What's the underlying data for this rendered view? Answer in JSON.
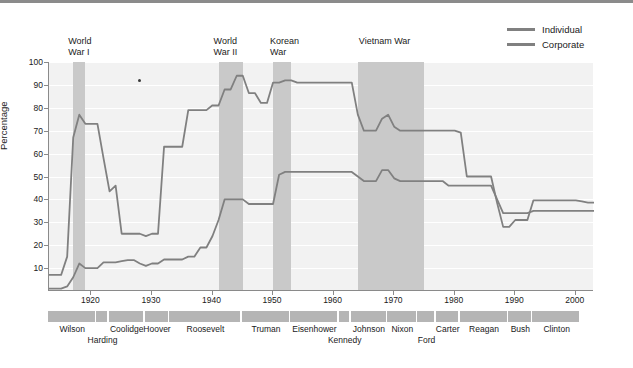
{
  "chart_data": {
    "type": "line",
    "title": "",
    "xlabel": "",
    "ylabel": "Percentage",
    "xlim": [
      1913,
      2003
    ],
    "ylim": [
      0,
      100
    ],
    "grid": true,
    "legend_position": "top-right",
    "yticks": [
      10,
      20,
      30,
      40,
      50,
      60,
      70,
      80,
      90,
      100
    ],
    "xticks": [
      1920,
      1930,
      1940,
      1950,
      1960,
      1970,
      1980,
      1990,
      2000
    ],
    "series": [
      {
        "name": "Individual",
        "color": "#808080",
        "points": [
          [
            1913,
            7
          ],
          [
            1914,
            7
          ],
          [
            1915,
            7
          ],
          [
            1916,
            15
          ],
          [
            1917,
            67
          ],
          [
            1918,
            77
          ],
          [
            1919,
            73
          ],
          [
            1920,
            73
          ],
          [
            1921,
            73
          ],
          [
            1922,
            58
          ],
          [
            1923,
            43.5
          ],
          [
            1924,
            46
          ],
          [
            1925,
            25
          ],
          [
            1926,
            25
          ],
          [
            1927,
            25
          ],
          [
            1928,
            25
          ],
          [
            1929,
            24
          ],
          [
            1930,
            25
          ],
          [
            1931,
            25
          ],
          [
            1932,
            63
          ],
          [
            1933,
            63
          ],
          [
            1934,
            63
          ],
          [
            1935,
            63
          ],
          [
            1936,
            79
          ],
          [
            1937,
            79
          ],
          [
            1938,
            79
          ],
          [
            1939,
            79
          ],
          [
            1940,
            81.1
          ],
          [
            1941,
            81
          ],
          [
            1942,
            88
          ],
          [
            1943,
            88
          ],
          [
            1944,
            94
          ],
          [
            1945,
            94
          ],
          [
            1946,
            86.45
          ],
          [
            1947,
            86.45
          ],
          [
            1948,
            82.13
          ],
          [
            1949,
            82.13
          ],
          [
            1950,
            91
          ],
          [
            1951,
            91
          ],
          [
            1952,
            92
          ],
          [
            1953,
            92
          ],
          [
            1954,
            91
          ],
          [
            1955,
            91
          ],
          [
            1956,
            91
          ],
          [
            1957,
            91
          ],
          [
            1958,
            91
          ],
          [
            1959,
            91
          ],
          [
            1960,
            91
          ],
          [
            1961,
            91
          ],
          [
            1962,
            91
          ],
          [
            1963,
            91
          ],
          [
            1964,
            77
          ],
          [
            1965,
            70
          ],
          [
            1966,
            70
          ],
          [
            1967,
            70
          ],
          [
            1968,
            75.25
          ],
          [
            1969,
            77
          ],
          [
            1970,
            71.75
          ],
          [
            1971,
            70
          ],
          [
            1972,
            70
          ],
          [
            1973,
            70
          ],
          [
            1974,
            70
          ],
          [
            1975,
            70
          ],
          [
            1976,
            70
          ],
          [
            1977,
            70
          ],
          [
            1978,
            70
          ],
          [
            1979,
            70
          ],
          [
            1980,
            70
          ],
          [
            1981,
            69.125
          ],
          [
            1982,
            50
          ],
          [
            1983,
            50
          ],
          [
            1984,
            50
          ],
          [
            1985,
            50
          ],
          [
            1986,
            50
          ],
          [
            1987,
            38.5
          ],
          [
            1988,
            28
          ],
          [
            1989,
            28
          ],
          [
            1990,
            31
          ],
          [
            1991,
            31
          ],
          [
            1992,
            31
          ],
          [
            1993,
            39.6
          ],
          [
            1994,
            39.6
          ],
          [
            1995,
            39.6
          ],
          [
            1996,
            39.6
          ],
          [
            1997,
            39.6
          ],
          [
            1998,
            39.6
          ],
          [
            1999,
            39.6
          ],
          [
            2000,
            39.6
          ],
          [
            2001,
            39.1
          ],
          [
            2002,
            38.6
          ],
          [
            2003,
            38.6
          ]
        ]
      },
      {
        "name": "Corporate",
        "color": "#808080",
        "points": [
          [
            1913,
            1
          ],
          [
            1914,
            1
          ],
          [
            1915,
            1
          ],
          [
            1916,
            2
          ],
          [
            1917,
            6
          ],
          [
            1918,
            12
          ],
          [
            1919,
            10
          ],
          [
            1920,
            10
          ],
          [
            1921,
            10
          ],
          [
            1922,
            12.5
          ],
          [
            1923,
            12.5
          ],
          [
            1924,
            12.5
          ],
          [
            1925,
            13
          ],
          [
            1926,
            13.5
          ],
          [
            1927,
            13.5
          ],
          [
            1928,
            12
          ],
          [
            1929,
            11
          ],
          [
            1930,
            12
          ],
          [
            1931,
            12
          ],
          [
            1932,
            13.75
          ],
          [
            1933,
            13.75
          ],
          [
            1934,
            13.75
          ],
          [
            1935,
            13.75
          ],
          [
            1936,
            15
          ],
          [
            1937,
            15
          ],
          [
            1938,
            19
          ],
          [
            1939,
            19
          ],
          [
            1940,
            24
          ],
          [
            1941,
            31
          ],
          [
            1942,
            40
          ],
          [
            1943,
            40
          ],
          [
            1944,
            40
          ],
          [
            1945,
            40
          ],
          [
            1946,
            38
          ],
          [
            1947,
            38
          ],
          [
            1948,
            38
          ],
          [
            1949,
            38
          ],
          [
            1950,
            38
          ],
          [
            1951,
            50.75
          ],
          [
            1952,
            52
          ],
          [
            1953,
            52
          ],
          [
            1954,
            52
          ],
          [
            1955,
            52
          ],
          [
            1956,
            52
          ],
          [
            1957,
            52
          ],
          [
            1958,
            52
          ],
          [
            1959,
            52
          ],
          [
            1960,
            52
          ],
          [
            1961,
            52
          ],
          [
            1962,
            52
          ],
          [
            1963,
            52
          ],
          [
            1964,
            50
          ],
          [
            1965,
            48
          ],
          [
            1966,
            48
          ],
          [
            1967,
            48
          ],
          [
            1968,
            52.8
          ],
          [
            1969,
            52.8
          ],
          [
            1970,
            49.2
          ],
          [
            1971,
            48
          ],
          [
            1972,
            48
          ],
          [
            1973,
            48
          ],
          [
            1974,
            48
          ],
          [
            1975,
            48
          ],
          [
            1976,
            48
          ],
          [
            1977,
            48
          ],
          [
            1978,
            48
          ],
          [
            1979,
            46
          ],
          [
            1980,
            46
          ],
          [
            1981,
            46
          ],
          [
            1982,
            46
          ],
          [
            1983,
            46
          ],
          [
            1984,
            46
          ],
          [
            1985,
            46
          ],
          [
            1986,
            46
          ],
          [
            1987,
            40
          ],
          [
            1988,
            34
          ],
          [
            1989,
            34
          ],
          [
            1990,
            34
          ],
          [
            1991,
            34
          ],
          [
            1992,
            34
          ],
          [
            1993,
            35
          ],
          [
            1994,
            35
          ],
          [
            1995,
            35
          ],
          [
            1996,
            35
          ],
          [
            1997,
            35
          ],
          [
            1998,
            35
          ],
          [
            1999,
            35
          ],
          [
            2000,
            35
          ],
          [
            2001,
            35
          ],
          [
            2002,
            35
          ],
          [
            2003,
            35
          ]
        ]
      }
    ],
    "shaded_regions": [
      {
        "label": "World\nWar I",
        "start": 1917,
        "end": 1919
      },
      {
        "label": "World\nWar II",
        "start": 1941,
        "end": 1945
      },
      {
        "label": "Korean\nWar",
        "start": 1950,
        "end": 1953
      },
      {
        "label": "Vietnam War",
        "start": 1964,
        "end": 1975
      }
    ],
    "annotations": [
      {
        "type": "point-marker",
        "x": 1928,
        "y": 92
      }
    ],
    "presidents": [
      {
        "name": "Wilson",
        "start": 1913,
        "end": 1921,
        "row": 0
      },
      {
        "name": "Harding",
        "start": 1921,
        "end": 1923,
        "row": 1
      },
      {
        "name": "Coolidge",
        "start": 1923,
        "end": 1929,
        "row": 0
      },
      {
        "name": "Hoover",
        "start": 1929,
        "end": 1933,
        "row": 0
      },
      {
        "name": "Roosevelt",
        "start": 1933,
        "end": 1945,
        "row": 0
      },
      {
        "name": "Truman",
        "start": 1945,
        "end": 1953,
        "row": 0
      },
      {
        "name": "Eisenhower",
        "start": 1953,
        "end": 1961,
        "row": 0
      },
      {
        "name": "Kennedy",
        "start": 1961,
        "end": 1963,
        "row": 1
      },
      {
        "name": "Johnson",
        "start": 1963,
        "end": 1969,
        "row": 0
      },
      {
        "name": "Nixon",
        "start": 1969,
        "end": 1974,
        "row": 0
      },
      {
        "name": "Ford",
        "start": 1974,
        "end": 1977,
        "row": 1
      },
      {
        "name": "Carter",
        "start": 1977,
        "end": 1981,
        "row": 0
      },
      {
        "name": "Reagan",
        "start": 1981,
        "end": 1989,
        "row": 0
      },
      {
        "name": "Bush",
        "start": 1989,
        "end": 1993,
        "row": 0
      },
      {
        "name": "Clinton",
        "start": 1993,
        "end": 2001,
        "row": 0
      }
    ]
  },
  "legend": {
    "items": [
      {
        "label": "Individual",
        "color": "#808080"
      },
      {
        "label": "Corporate",
        "color": "#808080"
      }
    ]
  },
  "colors": {
    "plot_background": "#f2f2f2",
    "war_band": "#c9c9c9",
    "grid": "#ffffff",
    "axis": "#8a8a8a",
    "president_band": "#b5b5b5",
    "line": "#808080"
  }
}
